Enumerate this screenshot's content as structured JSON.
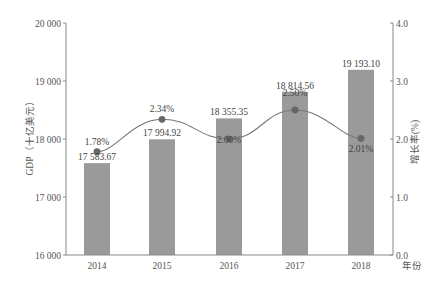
{
  "chart_data": {
    "type": "bar+line",
    "title": "",
    "categories": [
      "2014",
      "2015",
      "2016",
      "2017",
      "2018"
    ],
    "xlabel": "年份",
    "ylabel_left": "GDP（十亿美元）",
    "ylabel_right": "增长率(%)",
    "ylim_left": [
      16000,
      20000
    ],
    "ylim_right": [
      0.0,
      4.0
    ],
    "yticks_left": [
      "16 000",
      "17 000",
      "18 000",
      "19 000",
      "20 000"
    ],
    "yticks_right": [
      "0.0",
      "1.0",
      "2.0",
      "3.0",
      "4.0"
    ],
    "grid": false,
    "series": [
      {
        "name": "GDP",
        "type": "bar",
        "axis": "left",
        "values": [
          17583.67,
          17994.92,
          18355.35,
          18814.56,
          19193.1
        ],
        "labels": [
          "17 583.67",
          "17 994.92",
          "18 355.35",
          "18 814.56",
          "19 193.10"
        ],
        "color": "#9a9a9a"
      },
      {
        "name": "增长率",
        "type": "line",
        "axis": "right",
        "smooth": true,
        "values": [
          1.78,
          2.34,
          2.0,
          2.5,
          2.01
        ],
        "labels": [
          "1.78%",
          "2.34%",
          "2.00%",
          "2.50%",
          "2.01%"
        ],
        "color": "#777777",
        "marker_color": "#666666"
      }
    ]
  }
}
